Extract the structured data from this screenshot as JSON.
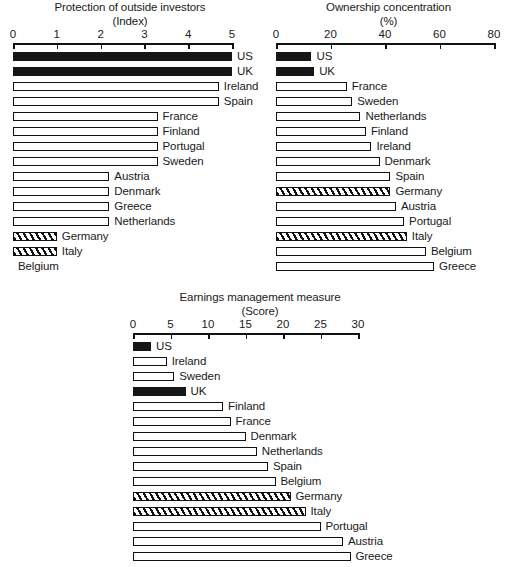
{
  "figure": {
    "background_color": "#ffffff",
    "ink_color": "#161616"
  },
  "chart_data": [
    {
      "id": "protection",
      "type": "bar",
      "orientation": "horizontal",
      "title": "Protection of outside investors",
      "subtitle": "(Index)",
      "xlabel": "",
      "ylabel": "",
      "unit": "Index",
      "xlim": [
        0,
        5
      ],
      "ticks": [
        0,
        1,
        2,
        3,
        4,
        5
      ],
      "tick_labels": [
        "0",
        "1",
        "2",
        "3",
        "4",
        "5"
      ],
      "grid": false,
      "legend": false,
      "sort": "descending",
      "categories": [
        "US",
        "UK",
        "Ireland",
        "Spain",
        "France",
        "Finland",
        "Portugal",
        "Sweden",
        "Austria",
        "Denmark",
        "Greece",
        "Netherlands",
        "Germany",
        "Italy",
        "Belgium"
      ],
      "values": [
        5.0,
        5.0,
        4.7,
        4.7,
        3.3,
        3.3,
        3.3,
        3.3,
        2.2,
        2.2,
        2.2,
        2.2,
        1.0,
        1.0,
        0.0
      ],
      "styles": [
        "solid",
        "solid",
        "open",
        "open",
        "open",
        "open",
        "open",
        "open",
        "open",
        "open",
        "open",
        "open",
        "hatch",
        "hatch",
        "none"
      ]
    },
    {
      "id": "ownership",
      "type": "bar",
      "orientation": "horizontal",
      "title": "Ownership concentration",
      "subtitle": "(%)",
      "xlabel": "",
      "ylabel": "",
      "unit": "%",
      "xlim": [
        0,
        80
      ],
      "ticks": [
        0,
        20,
        40,
        60,
        80
      ],
      "tick_labels": [
        "0",
        "20",
        "40",
        "60",
        "80"
      ],
      "grid": false,
      "legend": false,
      "sort": "ascending",
      "categories": [
        "US",
        "UK",
        "France",
        "Sweden",
        "Netherlands",
        "Finland",
        "Ireland",
        "Denmark",
        "Spain",
        "Germany",
        "Austria",
        "Portugal",
        "Italy",
        "Belgium",
        "Greece"
      ],
      "values": [
        13,
        14,
        26,
        28,
        31,
        33,
        35,
        38,
        42,
        42,
        44,
        47,
        48,
        55,
        58
      ],
      "styles": [
        "solid",
        "solid",
        "open",
        "open",
        "open",
        "open",
        "open",
        "open",
        "open",
        "hatch",
        "open",
        "open",
        "hatch",
        "open",
        "open"
      ]
    },
    {
      "id": "earnings",
      "type": "bar",
      "orientation": "horizontal",
      "title": "Earnings management measure",
      "subtitle": "(Score)",
      "xlabel": "",
      "ylabel": "",
      "unit": "Score",
      "xlim": [
        0,
        30
      ],
      "ticks": [
        0,
        5,
        10,
        15,
        20,
        25,
        30
      ],
      "tick_labels": [
        "0",
        "5",
        "10",
        "15",
        "20",
        "25",
        "30"
      ],
      "grid": false,
      "legend": false,
      "sort": "ascending",
      "categories": [
        "US",
        "Ireland",
        "Sweden",
        "UK",
        "Finland",
        "France",
        "Denmark",
        "Netherlands",
        "Spain",
        "Belgium",
        "Germany",
        "Italy",
        "Portugal",
        "Austria",
        "Greece"
      ],
      "values": [
        2.4,
        4.5,
        5.5,
        7.0,
        12.0,
        13.0,
        15.0,
        16.5,
        18.0,
        19.0,
        21.0,
        23.0,
        25.0,
        28.0,
        29.0
      ],
      "styles": [
        "solid",
        "open",
        "open",
        "solid",
        "open",
        "open",
        "open",
        "open",
        "open",
        "open",
        "hatch",
        "hatch",
        "open",
        "open",
        "open"
      ]
    }
  ]
}
